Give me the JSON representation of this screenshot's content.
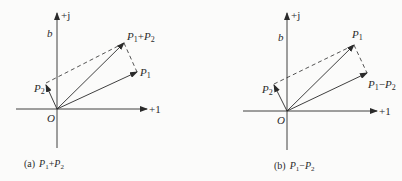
{
  "colors": {
    "ink": "#2a2a2a",
    "background": "#fbfbfa"
  },
  "diagram_a": {
    "caption_prefix": "(a)",
    "caption_expr": {
      "p": "P",
      "s1": "1",
      "op": "+",
      "s2": "2"
    },
    "axis_x_label": "+1",
    "axis_y_label": "+j",
    "b_label": "b",
    "origin_label": "O",
    "vectors": [
      {
        "name": "P1",
        "label": "P",
        "sub": "1",
        "tip": [
          137,
          72
        ]
      },
      {
        "name": "P2",
        "label": "P",
        "sub": "2",
        "tip": [
          46,
          87
        ]
      },
      {
        "name": "P1+P2",
        "label": "P",
        "sub": "1",
        "op": "+",
        "label2": "P",
        "sub2": "2",
        "tip": [
          124,
          43
        ]
      }
    ]
  },
  "diagram_b": {
    "caption_prefix": "(b)",
    "caption_expr": {
      "p": "P",
      "s1": "1",
      "op": "−",
      "s2": "2"
    },
    "axis_x_label": "+1",
    "axis_y_label": "+j",
    "b_label": "b",
    "origin_label": "O",
    "vectors": [
      {
        "name": "P1",
        "label": "P",
        "sub": "1",
        "tip": [
          354,
          45
        ]
      },
      {
        "name": "P2",
        "label": "P",
        "sub": "2",
        "tip": [
          274,
          85
        ]
      },
      {
        "name": "P1-P2",
        "label": "P",
        "sub": "1",
        "op": "−",
        "label2": "P",
        "sub2": "2",
        "tip": [
          367,
          73
        ]
      }
    ]
  }
}
